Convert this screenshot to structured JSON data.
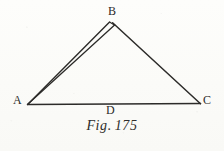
{
  "figure": {
    "caption_label": "Fig.",
    "caption_number": "175",
    "caption_full": "Fig. 175",
    "ink_color": "#2c2b29",
    "paper_color": "#fdfdfb"
  },
  "diagram": {
    "type": "triangle-with-doubled-side",
    "vertices": [
      {
        "name": "A",
        "label": "A",
        "x": 27,
        "y": 104
      },
      {
        "name": "B",
        "label": "B",
        "x": 112,
        "y": 22
      },
      {
        "name": "C",
        "label": "C",
        "x": 200,
        "y": 104
      }
    ],
    "points": [
      {
        "name": "D",
        "label": "D",
        "x": 113,
        "y": 104,
        "position": "midpoint-of-base-AC"
      }
    ],
    "edges": [
      {
        "name": "AB",
        "from": "A",
        "to": "B",
        "style": "doubled",
        "note": "two near-parallel strokes converging at A"
      },
      {
        "name": "BC",
        "from": "B",
        "to": "C",
        "style": "single"
      },
      {
        "name": "AC",
        "from": "A",
        "to": "C",
        "style": "single",
        "note": "base line, label D beneath"
      }
    ],
    "stroke_paths": {
      "base_AC": "M 27.5 104.2 L 200 103.4",
      "side_BC": "M 112.4 22.6 L 200 103.4",
      "side_AB_outer": "M 27.5 104.2 L 109.8 22.2",
      "side_AB_inner": "M 27.8 104.0 L 114.4 24.6"
    }
  }
}
